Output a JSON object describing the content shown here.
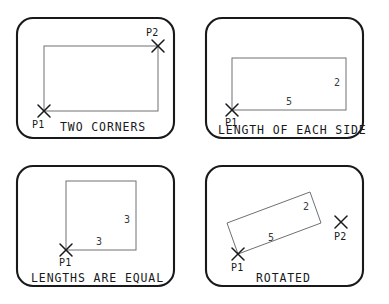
{
  "figure": {
    "background_color": "#ffffff",
    "frame_color": "#17191a",
    "shape_color": "#6e7073",
    "mark_color": "#17191a"
  },
  "panels": [
    {
      "id": "two-corners",
      "caption": "TWO CORNERS",
      "shape": "rectangle",
      "points": [
        {
          "label": "P1",
          "position": "bottom-left",
          "marker": "x"
        },
        {
          "label": "P2",
          "position": "top-right",
          "marker": "x"
        }
      ],
      "dimensions": []
    },
    {
      "id": "length-of-each-side",
      "caption": "LENGTH OF EACH SIDE",
      "shape": "rectangle",
      "points": [
        {
          "label": "P1",
          "position": "bottom-left",
          "marker": "x"
        }
      ],
      "dimensions": [
        {
          "label": "5",
          "side": "bottom"
        },
        {
          "label": "2",
          "side": "right"
        }
      ]
    },
    {
      "id": "lengths-are-equal",
      "caption": "LENGTHS ARE EQUAL",
      "shape": "square",
      "points": [
        {
          "label": "P1",
          "position": "bottom-left",
          "marker": "x"
        }
      ],
      "dimensions": [
        {
          "label": "3",
          "side": "bottom"
        },
        {
          "label": "3",
          "side": "right"
        }
      ]
    },
    {
      "id": "rotated",
      "caption": "ROTATED",
      "shape": "rotated-rectangle",
      "points": [
        {
          "label": "P1",
          "position": "bottom-left",
          "marker": "x"
        },
        {
          "label": "P2",
          "position": "right-outside",
          "marker": "x"
        }
      ],
      "dimensions": [
        {
          "label": "5",
          "side": "bottom"
        },
        {
          "label": "2",
          "side": "right"
        }
      ]
    }
  ]
}
